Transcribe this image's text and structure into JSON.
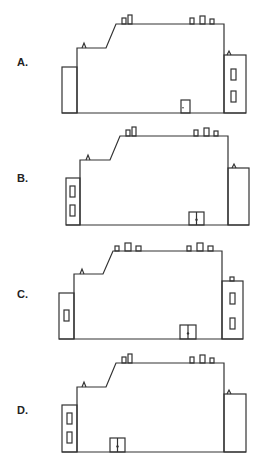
{
  "options": [
    {
      "label": "A.",
      "top": 0,
      "label_y": 56,
      "left_annex": {
        "x": 62,
        "y": 67,
        "w": 15,
        "h": 46,
        "windows": []
      },
      "main": {
        "left": 77,
        "right": 224,
        "base": 113,
        "low_roof": 48,
        "slope_x1": 106,
        "slope_x2": 116,
        "high_roof": 24
      },
      "left_vent": {
        "x": 84,
        "y": 48
      },
      "right_annex": {
        "x": 224,
        "y": 55,
        "w": 22,
        "h": 58,
        "windows": [
          {
            "x": 231,
            "y": 69,
            "w": 5,
            "h": 11
          },
          {
            "x": 231,
            "y": 91,
            "w": 5,
            "h": 11
          }
        ],
        "vent": "triangle",
        "vent_x": 229
      },
      "chimneys": [
        {
          "x": 122,
          "w": 4,
          "h": 6
        },
        {
          "x": 128,
          "w": 4,
          "h": 9
        },
        {
          "x": 190,
          "w": 4,
          "h": 6
        },
        {
          "x": 200,
          "w": 5,
          "h": 8
        },
        {
          "x": 210,
          "w": 4,
          "h": 5
        }
      ],
      "door": {
        "x": 181,
        "y": 100,
        "w": 9,
        "h": 13,
        "type": "single"
      }
    },
    {
      "label": "B.",
      "top": 116,
      "label_y": 56,
      "left_annex": {
        "x": 66,
        "y": 62,
        "w": 14,
        "h": 47,
        "windows": [
          {
            "x": 70,
            "y": 70,
            "w": 5,
            "h": 11
          },
          {
            "x": 70,
            "y": 89,
            "w": 5,
            "h": 11
          }
        ]
      },
      "main": {
        "left": 80,
        "right": 228,
        "base": 109,
        "low_roof": 44,
        "slope_x1": 110,
        "slope_x2": 120,
        "high_roof": 20
      },
      "left_vent": {
        "x": 88,
        "y": 44
      },
      "right_annex": {
        "x": 228,
        "y": 52,
        "w": 21,
        "h": 57,
        "windows": [],
        "vent": "triangle",
        "vent_x": 234
      },
      "chimneys": [
        {
          "x": 126,
          "w": 4,
          "h": 6
        },
        {
          "x": 132,
          "w": 4,
          "h": 9
        },
        {
          "x": 194,
          "w": 4,
          "h": 6
        },
        {
          "x": 204,
          "w": 5,
          "h": 8
        },
        {
          "x": 214,
          "w": 4,
          "h": 5
        }
      ],
      "door": {
        "x": 189,
        "y": 96,
        "w": 15,
        "h": 13,
        "type": "double"
      }
    },
    {
      "label": "C.",
      "top": 232,
      "label_y": 56,
      "left_annex": {
        "x": 59,
        "y": 61,
        "w": 15,
        "h": 46,
        "windows": [
          {
            "x": 64,
            "y": 78,
            "w": 5,
            "h": 11
          }
        ]
      },
      "main": {
        "left": 74,
        "right": 222,
        "base": 107,
        "low_roof": 42,
        "slope_x1": 103,
        "slope_x2": 113,
        "high_roof": 19
      },
      "left_vent": {
        "x": 82,
        "y": 42
      },
      "right_annex": {
        "x": 222,
        "y": 49,
        "w": 21,
        "h": 58,
        "windows": [
          {
            "x": 230,
            "y": 61,
            "w": 5,
            "h": 11
          },
          {
            "x": 230,
            "y": 86,
            "w": 5,
            "h": 11
          }
        ],
        "vent": "chimney",
        "vent_x": 230
      },
      "chimneys": [
        {
          "x": 115,
          "w": 4,
          "h": 5
        },
        {
          "x": 125,
          "w": 6,
          "h": 8
        },
        {
          "x": 136,
          "w": 5,
          "h": 5
        },
        {
          "x": 187,
          "w": 4,
          "h": 5
        },
        {
          "x": 197,
          "w": 6,
          "h": 8
        },
        {
          "x": 208,
          "w": 5,
          "h": 5
        }
      ],
      "door": {
        "x": 180,
        "y": 93,
        "w": 16,
        "h": 14,
        "type": "double"
      }
    },
    {
      "label": "D.",
      "top": 348,
      "label_y": 56,
      "left_annex": {
        "x": 62,
        "y": 57,
        "w": 15,
        "h": 47,
        "windows": [
          {
            "x": 67,
            "y": 65,
            "w": 5,
            "h": 11
          },
          {
            "x": 67,
            "y": 84,
            "w": 5,
            "h": 11
          }
        ]
      },
      "main": {
        "left": 77,
        "right": 224,
        "base": 104,
        "low_roof": 39,
        "slope_x1": 106,
        "slope_x2": 116,
        "high_roof": 15
      },
      "left_vent": {
        "x": 84,
        "y": 39
      },
      "right_annex": {
        "x": 224,
        "y": 46,
        "w": 22,
        "h": 58,
        "windows": [],
        "vent": "triangle",
        "vent_x": 229
      },
      "chimneys": [
        {
          "x": 122,
          "w": 4,
          "h": 6
        },
        {
          "x": 128,
          "w": 4,
          "h": 9
        },
        {
          "x": 190,
          "w": 4,
          "h": 6
        },
        {
          "x": 200,
          "w": 5,
          "h": 8
        },
        {
          "x": 210,
          "w": 4,
          "h": 5
        }
      ],
      "door": {
        "x": 110,
        "y": 90,
        "w": 15,
        "h": 14,
        "type": "double"
      }
    }
  ]
}
